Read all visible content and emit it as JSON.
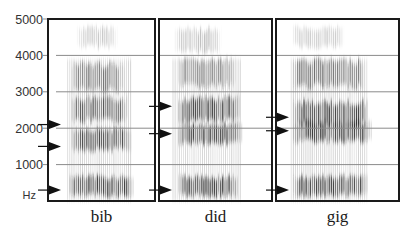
{
  "figure": {
    "title": "",
    "y_axis": {
      "unit_label": "Hz",
      "min": 0,
      "max": 5000,
      "ticks": [
        {
          "value": 5000,
          "label": "5000"
        },
        {
          "value": 4000,
          "label": "4000"
        },
        {
          "value": 3000,
          "label": "3000"
        },
        {
          "value": 2000,
          "label": "2000"
        },
        {
          "value": 1000,
          "label": "1000"
        }
      ],
      "gridlines": [
        4000,
        3000,
        2000,
        1000
      ]
    },
    "panels": [
      {
        "word": "bib",
        "formant_arrows_hz": [
          2100,
          1500,
          300
        ],
        "voicing_onset": 0.18,
        "voicing_offset": 0.78,
        "bands": [
          {
            "center_hz": 4500,
            "width_hz": 500,
            "intensity": 0.25,
            "start": 0.25,
            "end": 0.65
          },
          {
            "center_hz": 3400,
            "width_hz": 700,
            "intensity": 0.55,
            "start": 0.2,
            "end": 0.72
          },
          {
            "center_hz": 2500,
            "width_hz": 600,
            "intensity": 0.75,
            "start": 0.2,
            "end": 0.75
          },
          {
            "center_hz": 1700,
            "width_hz": 550,
            "intensity": 0.75,
            "start": 0.2,
            "end": 0.78
          },
          {
            "center_hz": 400,
            "width_hz": 500,
            "intensity": 0.85,
            "start": 0.18,
            "end": 0.8
          }
        ]
      },
      {
        "word": "did",
        "formant_arrows_hz": [
          2600,
          1850,
          300
        ],
        "voicing_onset": 0.12,
        "voicing_offset": 0.72,
        "bands": [
          {
            "center_hz": 4400,
            "width_hz": 600,
            "intensity": 0.3,
            "start": 0.12,
            "end": 0.55
          },
          {
            "center_hz": 3500,
            "width_hz": 700,
            "intensity": 0.5,
            "start": 0.15,
            "end": 0.68
          },
          {
            "center_hz": 2500,
            "width_hz": 600,
            "intensity": 0.85,
            "start": 0.15,
            "end": 0.72
          },
          {
            "center_hz": 1850,
            "width_hz": 500,
            "intensity": 0.85,
            "start": 0.15,
            "end": 0.74
          },
          {
            "center_hz": 400,
            "width_hz": 500,
            "intensity": 0.85,
            "start": 0.15,
            "end": 0.7
          }
        ]
      },
      {
        "word": "gig",
        "formant_arrows_hz": [
          2300,
          1930,
          300
        ],
        "voicing_onset": 0.12,
        "voicing_offset": 0.75,
        "bands": [
          {
            "center_hz": 4500,
            "width_hz": 500,
            "intensity": 0.25,
            "start": 0.12,
            "end": 0.55
          },
          {
            "center_hz": 3500,
            "width_hz": 700,
            "intensity": 0.6,
            "start": 0.12,
            "end": 0.72
          },
          {
            "center_hz": 2400,
            "width_hz": 600,
            "intensity": 0.85,
            "start": 0.12,
            "end": 0.75
          },
          {
            "center_hz": 1900,
            "width_hz": 500,
            "intensity": 0.85,
            "start": 0.12,
            "end": 0.78
          },
          {
            "center_hz": 400,
            "width_hz": 500,
            "intensity": 0.8,
            "start": 0.12,
            "end": 0.75
          }
        ]
      }
    ]
  },
  "colors": {
    "ink": "#111111",
    "grid": "#8a8a8a",
    "band": "#1e1e1e"
  }
}
